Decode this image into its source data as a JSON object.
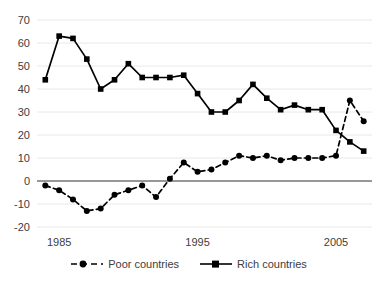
{
  "chart_data": {
    "type": "line",
    "title": "",
    "xlabel": "",
    "ylabel": "",
    "x": [
      1984,
      1985,
      1986,
      1987,
      1988,
      1989,
      1990,
      1991,
      1992,
      1993,
      1994,
      1995,
      1996,
      1997,
      1998,
      1999,
      2000,
      2001,
      2002,
      2003,
      2004,
      2005,
      2006,
      2007
    ],
    "xlim": [
      1983.4,
      2007.6
    ],
    "ylim": [
      -20,
      70
    ],
    "xticks": [
      1985,
      1995,
      2005
    ],
    "xtick_labels": [
      "1985",
      "1995",
      "2005"
    ],
    "yticks": [
      -20,
      -10,
      0,
      10,
      20,
      30,
      40,
      50,
      60,
      70
    ],
    "ytick_labels": [
      "-20",
      "-10",
      "0",
      "10",
      "20",
      "30",
      "40",
      "50",
      "60",
      "70"
    ],
    "grid": true,
    "grid_axis": "y",
    "zero_line": true,
    "legend_position": "bottom",
    "series": [
      {
        "name": "Poor countries",
        "marker": "circle",
        "line_style": "dashed",
        "color": "#000000",
        "values": [
          -2,
          -4,
          -8,
          -13,
          -12,
          -6,
          -4,
          -2,
          -7,
          1,
          8,
          4,
          5,
          8,
          11,
          10,
          11,
          9,
          10,
          10,
          10,
          11,
          35,
          26
        ]
      },
      {
        "name": "Rich countries",
        "marker": "square",
        "line_style": "solid",
        "color": "#000000",
        "values": [
          44,
          63,
          62,
          53,
          40,
          44,
          51,
          45,
          45,
          45,
          46,
          38,
          30,
          30,
          35,
          42,
          36,
          31,
          33,
          31,
          31,
          22,
          17,
          13
        ]
      }
    ]
  },
  "legend": {
    "items": [
      {
        "label": "Poor countries",
        "marker": "circle",
        "style": "dashed"
      },
      {
        "label": "Rich countries",
        "marker": "square",
        "style": "solid"
      }
    ]
  },
  "colors": {
    "series": "#000000",
    "grid": "#e8e8e8",
    "axis": "#3d3d3d",
    "tick_text": "#404040",
    "background": "#ffffff"
  }
}
